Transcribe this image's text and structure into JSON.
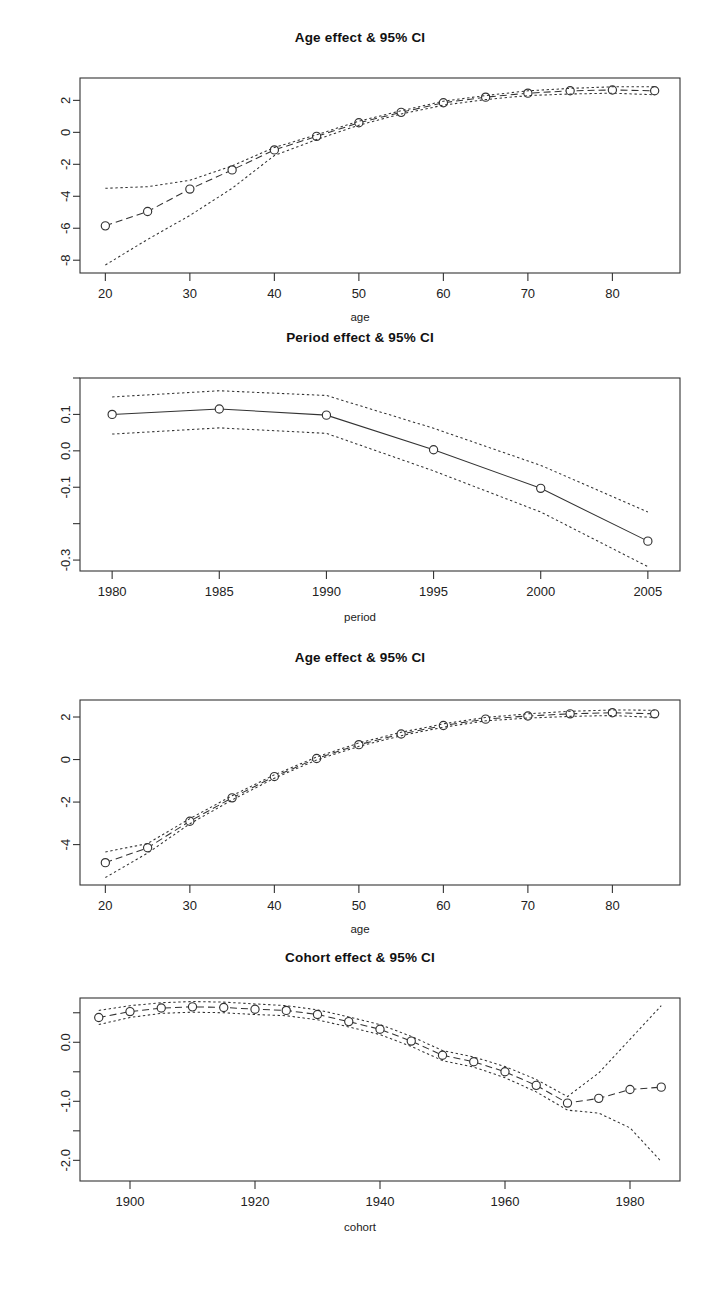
{
  "figure": {
    "background": "#ffffff",
    "line_color": "#333333",
    "point_symbol": "open-circle"
  },
  "panels": [
    {
      "id": "age-effect-top",
      "title": "Age effect & 95% CI",
      "xlabel": "age",
      "ylabel": "",
      "chart_data": {
        "type": "line",
        "title": "Age effect & 95% CI",
        "xlabel": "age",
        "ylabel": "",
        "xlim": [
          17,
          88
        ],
        "ylim": [
          -8.8,
          3.4
        ],
        "xticks": [
          20,
          30,
          40,
          50,
          60,
          70,
          80
        ],
        "xtick_labels": [
          "20",
          "30",
          "40",
          "50",
          "60",
          "70",
          "80"
        ],
        "yticks": [
          2,
          0,
          -2,
          -4,
          -6,
          -8
        ],
        "ytick_labels": [
          "2",
          "0",
          "-2",
          "-4",
          "-6",
          "-8"
        ],
        "grid": false,
        "legend": "none",
        "x": [
          20,
          25,
          30,
          35,
          40,
          45,
          50,
          55,
          60,
          65,
          70,
          75,
          80,
          85
        ],
        "series": [
          {
            "name": "estimate",
            "style": "dashed-with-circles",
            "values": [
              -5.85,
              -4.95,
              -3.55,
              -2.35,
              -1.1,
              -0.25,
              0.6,
              1.25,
              1.85,
              2.2,
              2.45,
              2.6,
              2.65,
              2.6
            ]
          },
          {
            "name": "upper 95% CI",
            "style": "dotted",
            "values": [
              -3.5,
              -3.4,
              -3.0,
              -2.1,
              -0.95,
              -0.15,
              0.7,
              1.35,
              1.95,
              2.3,
              2.6,
              2.75,
              2.85,
              2.85
            ]
          },
          {
            "name": "lower 95% CI",
            "style": "dotted",
            "values": [
              -8.3,
              -6.7,
              -5.2,
              -3.5,
              -1.45,
              -0.45,
              0.45,
              1.15,
              1.7,
              2.05,
              2.3,
              2.4,
              2.45,
              2.35
            ]
          }
        ]
      }
    },
    {
      "id": "period-effect",
      "title": "Period effect & 95% CI",
      "xlabel": "period",
      "ylabel": "",
      "chart_data": {
        "type": "line",
        "title": "Period effect & 95% CI",
        "xlabel": "period",
        "ylabel": "",
        "xlim": [
          1978.5,
          2006.5
        ],
        "ylim": [
          -0.33,
          0.2
        ],
        "xticks": [
          1980,
          1985,
          1990,
          1995,
          2000,
          2005
        ],
        "xtick_labels": [
          "1980",
          "1985",
          "1990",
          "1995",
          "2000",
          "2005"
        ],
        "yticks": [
          0.2,
          0.1,
          0.0,
          -0.1,
          -0.2,
          -0.3
        ],
        "ytick_labels": [
          "",
          "0.1",
          "0.0",
          "-0.1",
          "",
          "-0.3"
        ],
        "grid": false,
        "legend": "none",
        "x": [
          1980,
          1985,
          1990,
          1995,
          2000,
          2005
        ],
        "series": [
          {
            "name": "estimate",
            "style": "solid-with-circles",
            "values": [
              0.1,
              0.115,
              0.098,
              0.003,
              -0.103,
              -0.248
            ]
          },
          {
            "name": "upper 95% CI",
            "style": "dotted",
            "values": [
              0.148,
              0.165,
              0.152,
              0.062,
              -0.04,
              -0.168
            ]
          },
          {
            "name": "lower 95% CI",
            "style": "dotted",
            "values": [
              0.046,
              0.063,
              0.048,
              -0.055,
              -0.168,
              -0.318
            ]
          }
        ]
      }
    },
    {
      "id": "age-effect-bottom",
      "title": "Age effect & 95% CI",
      "xlabel": "age",
      "ylabel": "",
      "chart_data": {
        "type": "line",
        "title": "Age effect & 95% CI",
        "xlabel": "age",
        "ylabel": "",
        "xlim": [
          17,
          88
        ],
        "ylim": [
          -5.9,
          2.8
        ],
        "xticks": [
          20,
          30,
          40,
          50,
          60,
          70,
          80
        ],
        "xtick_labels": [
          "20",
          "30",
          "40",
          "50",
          "60",
          "70",
          "80"
        ],
        "yticks": [
          2,
          0,
          -2,
          -4
        ],
        "ytick_labels": [
          "2",
          "0",
          "-2",
          "-4"
        ],
        "grid": false,
        "legend": "none",
        "x": [
          20,
          25,
          30,
          35,
          40,
          45,
          50,
          55,
          60,
          65,
          70,
          75,
          80,
          85
        ],
        "series": [
          {
            "name": "estimate",
            "style": "dashed-with-circles",
            "values": [
              -4.85,
              -4.15,
              -2.9,
              -1.8,
              -0.8,
              0.05,
              0.7,
              1.2,
              1.6,
              1.9,
              2.05,
              2.15,
              2.2,
              2.15
            ]
          },
          {
            "name": "upper 95% CI",
            "style": "dotted",
            "values": [
              -4.35,
              -3.95,
              -2.78,
              -1.7,
              -0.72,
              0.12,
              0.78,
              1.28,
              1.68,
              1.98,
              2.15,
              2.27,
              2.33,
              2.32
            ]
          },
          {
            "name": "lower 95% CI",
            "style": "dotted",
            "values": [
              -5.55,
              -4.4,
              -3.02,
              -1.9,
              -0.88,
              -0.02,
              0.62,
              1.12,
              1.52,
              1.82,
              1.95,
              2.03,
              2.07,
              1.98
            ]
          }
        ]
      }
    },
    {
      "id": "cohort-effect",
      "title": "Cohort effect & 95% CI",
      "xlabel": "cohort",
      "ylabel": "",
      "chart_data": {
        "type": "line",
        "title": "Cohort effect & 95% CI",
        "xlabel": "cohort",
        "ylabel": "",
        "xlim": [
          1892,
          1988
        ],
        "ylim": [
          -2.35,
          0.75
        ],
        "xticks": [
          1900,
          1920,
          1940,
          1960,
          1980
        ],
        "xtick_labels": [
          "1900",
          "1920",
          "1940",
          "1960",
          "1980"
        ],
        "yticks": [
          0.5,
          0.0,
          -0.5,
          -1.0,
          -1.5,
          -2.0
        ],
        "ytick_labels": [
          "",
          "0.0",
          "",
          "-1.0",
          "",
          "-2.0"
        ],
        "grid": false,
        "legend": "none",
        "x": [
          1895,
          1900,
          1905,
          1910,
          1915,
          1920,
          1925,
          1930,
          1935,
          1940,
          1945,
          1950,
          1955,
          1960,
          1965,
          1970,
          1975,
          1980,
          1985
        ],
        "series": [
          {
            "name": "estimate",
            "style": "dashed-with-circles",
            "values": [
              0.42,
              0.52,
              0.58,
              0.6,
              0.59,
              0.56,
              0.54,
              0.47,
              0.35,
              0.22,
              0.02,
              -0.22,
              -0.33,
              -0.5,
              -0.73,
              -1.03,
              -0.95,
              -0.8,
              -0.76
            ]
          },
          {
            "name": "upper 95% CI",
            "style": "dotted",
            "values": [
              0.54,
              0.62,
              0.67,
              0.69,
              0.68,
              0.65,
              0.62,
              0.55,
              0.43,
              0.3,
              0.1,
              -0.14,
              -0.25,
              -0.41,
              -0.63,
              -0.92,
              -0.52,
              0.05,
              0.62
            ]
          },
          {
            "name": "lower 95% CI",
            "style": "dotted",
            "values": [
              0.3,
              0.42,
              0.49,
              0.51,
              0.5,
              0.47,
              0.45,
              0.38,
              0.26,
              0.13,
              -0.07,
              -0.31,
              -0.42,
              -0.6,
              -0.84,
              -1.15,
              -1.2,
              -1.45,
              -2.02
            ]
          }
        ]
      }
    }
  ]
}
